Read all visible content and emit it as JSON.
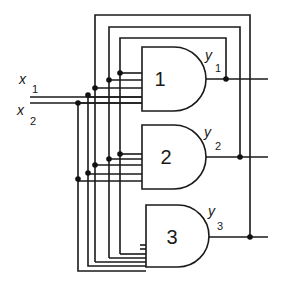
{
  "diagram": {
    "type": "combinational logic circuit",
    "inputs": [
      {
        "name": "x",
        "subscript": "1"
      },
      {
        "name": "x",
        "subscript": "2"
      }
    ],
    "gates": [
      {
        "id": "1",
        "type": "AND",
        "output": {
          "name": "y",
          "subscript": "1"
        }
      },
      {
        "id": "2",
        "type": "AND",
        "output": {
          "name": "y",
          "subscript": "2"
        }
      },
      {
        "id": "3",
        "type": "AND",
        "output": {
          "name": "y",
          "subscript": "3"
        }
      }
    ],
    "colors": {
      "line": "#1a1a1a",
      "background": "#ffffff"
    }
  }
}
